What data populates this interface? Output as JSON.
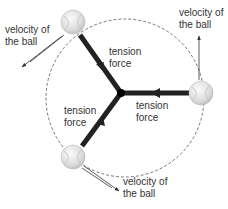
{
  "diagram": {
    "labels": {
      "velocity_top_left": [
        "velocity of",
        "the ball"
      ],
      "velocity_top_right": [
        "velocity of",
        "the ball"
      ],
      "velocity_bottom": [
        "velocity of",
        "the ball"
      ],
      "tension_top": [
        "tension",
        "force"
      ],
      "tension_right": [
        "tension",
        "force"
      ],
      "tension_left": [
        "tension",
        "force"
      ]
    },
    "colors": {
      "string": "#222222",
      "ball": "#e4e4e4",
      "dashed_path": "#555555",
      "velocity_arrow": "#333333",
      "text": "#333333"
    }
  }
}
